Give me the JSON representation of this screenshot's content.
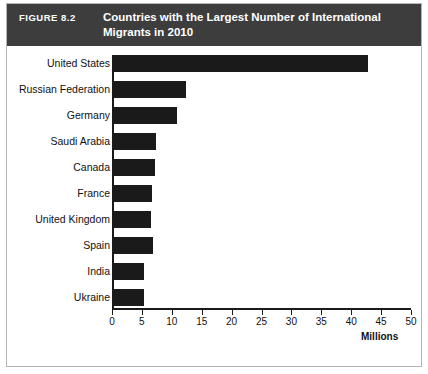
{
  "figure": {
    "number_label": "FIGURE 8.2",
    "title": "Countries with the Largest Number of International Migrants in 2010",
    "header_bg": "#3d3d3d",
    "bar_color": "#1a1a1a",
    "panel_border": "#b5b5b5"
  },
  "chart_data": {
    "type": "bar",
    "orientation": "horizontal",
    "title": "Countries with the Largest Number of International Migrants in 2010",
    "xlabel": "Millions",
    "ylabel": "",
    "xlim": [
      0,
      50
    ],
    "xticks": [
      0,
      5,
      10,
      15,
      20,
      25,
      30,
      35,
      40,
      45,
      50
    ],
    "xtick_labels": [
      "0",
      "5",
      "10",
      "15",
      "20",
      "25",
      "30",
      "35",
      "40",
      "45",
      "50"
    ],
    "grid": false,
    "legend": false,
    "categories": [
      "United States",
      "Russian Federation",
      "Germany",
      "Saudi Arabia",
      "Canada",
      "France",
      "United Kingdom",
      "Spain",
      "India",
      "Ukraine"
    ],
    "values": [
      42.8,
      12.3,
      10.8,
      7.3,
      7.2,
      6.7,
      6.5,
      6.9,
      5.4,
      5.3
    ]
  }
}
